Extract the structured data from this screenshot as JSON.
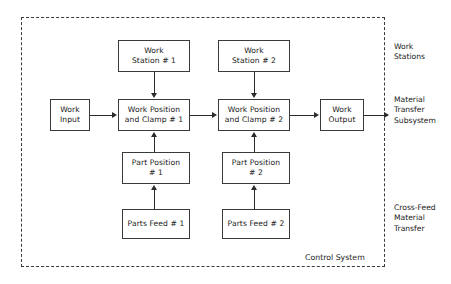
{
  "diagram": {
    "title": "Control System",
    "boundary_label": "Control System",
    "nodes": [
      {
        "id": "work-station-1",
        "lines": [
          "Work",
          "Station # 1"
        ]
      },
      {
        "id": "work-station-2",
        "lines": [
          "Work",
          "Station # 2"
        ]
      },
      {
        "id": "work-input",
        "lines": [
          "Work",
          "Input"
        ]
      },
      {
        "id": "work-position-clamp-1",
        "lines": [
          "Work Position",
          "and Clamp # 1"
        ]
      },
      {
        "id": "work-position-clamp-2",
        "lines": [
          "Work Position",
          "and Clamp # 2"
        ]
      },
      {
        "id": "work-output",
        "lines": [
          "Work",
          "Output"
        ]
      },
      {
        "id": "part-position-1",
        "lines": [
          "Part Position",
          "# 1"
        ]
      },
      {
        "id": "part-position-2",
        "lines": [
          "Part Position",
          "# 2"
        ]
      },
      {
        "id": "parts-feed-1",
        "lines": [
          "Parts Feed # 1"
        ]
      },
      {
        "id": "parts-feed-2",
        "lines": [
          "Parts Feed # 2"
        ]
      }
    ],
    "side_labels": [
      {
        "id": "work-stations",
        "lines": [
          "Work",
          "Stations"
        ]
      },
      {
        "id": "material-transfer-subsystem",
        "lines": [
          "Material",
          "Transfer",
          "Subsystem"
        ]
      },
      {
        "id": "cross-feed-material-transfer",
        "lines": [
          "Cross-Feed",
          "Material",
          "Transfer"
        ]
      }
    ],
    "colors": {
      "line": "#2b2b2b",
      "frame": "#3a3a3a",
      "text": "#1a1a1a",
      "background": "#ffffff"
    }
  }
}
